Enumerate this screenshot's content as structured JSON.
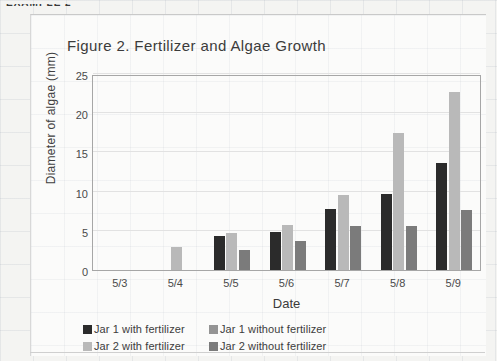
{
  "page": {
    "top_fragment": "EXAMPLE 2"
  },
  "chart_data": {
    "type": "bar",
    "title": "Figure 2. Fertilizer and Algae Growth",
    "xlabel": "Date",
    "ylabel": "Diameter of algae (mm)",
    "categories": [
      "5/3",
      "5/4",
      "5/5",
      "5/6",
      "5/7",
      "5/8",
      "5/9"
    ],
    "ylim": [
      0,
      25
    ],
    "yticks": [
      0,
      5,
      10,
      15,
      20,
      25
    ],
    "grid": true,
    "legend_position": "bottom",
    "series": [
      {
        "name": "Jar 1 with fertilizer",
        "color": "#2b2b2b",
        "values": [
          0,
          0,
          4.3,
          4.9,
          7.8,
          9.7,
          13.7
        ]
      },
      {
        "name": "Jar 2 with fertilizer",
        "color": "#b9b9b9",
        "values": [
          0,
          2.9,
          4.7,
          5.7,
          9.6,
          17.5,
          22.7
        ]
      },
      {
        "name": "Jar 1 without fertilizer",
        "color": "#949494",
        "values": [
          0,
          0,
          0,
          0,
          0,
          0,
          0
        ]
      },
      {
        "name": "Jar 2 without fertilizer",
        "color": "#7b7b7b",
        "values": [
          0,
          0,
          2.5,
          3.7,
          5.6,
          5.6,
          7.7
        ]
      }
    ]
  },
  "legend": {
    "entries": [
      {
        "label": "Jar 1 with fertilizer",
        "color": "#2b2b2b"
      },
      {
        "label": "Jar 1 without fertilizer",
        "color": "#949494"
      },
      {
        "label": "Jar 2 with fertilizer",
        "color": "#b9b9b9"
      },
      {
        "label": "Jar 2 without fertilizer",
        "color": "#7b7b7b"
      }
    ]
  }
}
